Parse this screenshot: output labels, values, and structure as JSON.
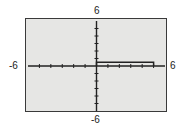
{
  "chart_data": {
    "type": "line",
    "title": "",
    "xlabel": "",
    "ylabel": "",
    "xlim": [
      -6,
      6
    ],
    "ylim": [
      -6,
      6
    ],
    "grid": false,
    "tick_labels": {
      "xmin": "-6",
      "xmax": "6",
      "ymin": "-6",
      "ymax": "6"
    },
    "xticks_step": 1,
    "yticks_step": 1,
    "series": [
      {
        "name": "graph",
        "points": [
          [
            0,
            0
          ],
          [
            0,
            0.5
          ],
          [
            5,
            0.5
          ],
          [
            5,
            0
          ]
        ]
      }
    ]
  },
  "labels": {
    "ymax": "6",
    "ymin": "-6",
    "xmin": "-6",
    "xmax": "6"
  },
  "colors": {
    "background": "#e6e6e4",
    "axis": "#222222",
    "frame": "#3a3a3a"
  }
}
